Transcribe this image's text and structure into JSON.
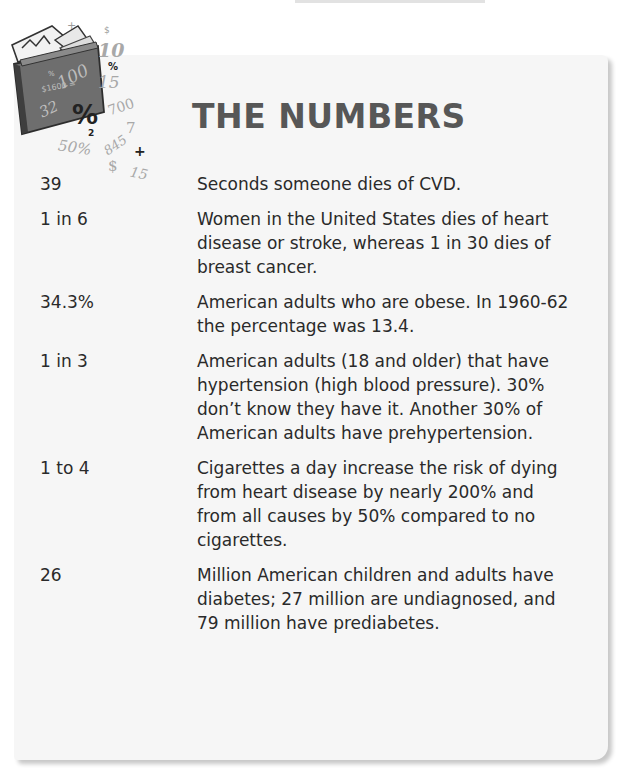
{
  "card": {
    "title": "THE NUMBERS",
    "background": "#f6f6f6",
    "title_color": "#575757"
  },
  "illustration": {
    "icon": "folder-of-numbers-icon",
    "glyphs": [
      "+",
      "$",
      "10",
      "%",
      "100",
      "15",
      "32",
      "%",
      "700",
      "2",
      "7",
      "50%",
      "845",
      "+",
      "$",
      "15"
    ]
  },
  "rows": [
    {
      "number": "39",
      "description": "Seconds someone dies of CVD."
    },
    {
      "number": "1 in 6",
      "description": "Women in the United States dies of heart disease or stroke, whereas 1 in 30 dies of breast cancer."
    },
    {
      "number": "34.3%",
      "description": "American adults who are obese. In 1960-62 the percentage was 13.4."
    },
    {
      "number": "1 in 3",
      "description": "American adults (18 and older) that have hypertension (high blood pressure). 30% don’t know they have it. Another 30% of American adults have prehypertension."
    },
    {
      "number": "1 to 4",
      "description": "Cigarettes a day increase the risk of dying from heart disease by nearly 200% and from all causes by 50% compared to no cigarettes."
    },
    {
      "number": "26",
      "description": "Million American children and adults have diabetes; 27 million are undiagnosed, and 79 million have prediabetes."
    }
  ]
}
